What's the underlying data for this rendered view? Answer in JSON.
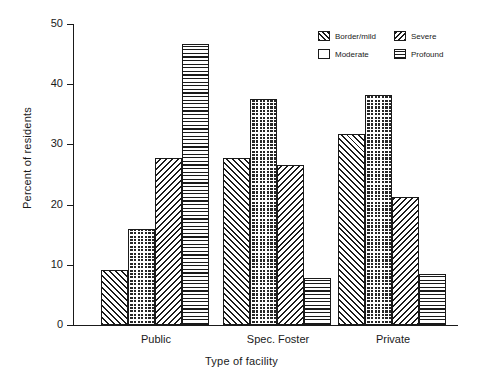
{
  "chart_data": {
    "type": "bar",
    "title": "",
    "subtitle": "",
    "xlabel": "Type of facility",
    "ylabel": "Percent of residents",
    "categories": [
      "Public",
      "Spec. Foster",
      "Private"
    ],
    "series": [
      {
        "name": "Border/mild",
        "pattern": "diagonal-forward-hatch",
        "values": [
          9.2,
          27.8,
          31.8
        ]
      },
      {
        "name": "Moderate",
        "pattern": "dark-checkered",
        "values": [
          16.0,
          37.5,
          38.2
        ]
      },
      {
        "name": "Severe",
        "pattern": "diagonal-back-hatch",
        "values": [
          27.8,
          26.5,
          21.3
        ]
      },
      {
        "name": "Profound",
        "pattern": "horizontal-lines",
        "values": [
          46.7,
          7.8,
          8.5
        ]
      }
    ],
    "ylim": [
      0,
      50
    ],
    "yticks": [
      0,
      10,
      20,
      30,
      40,
      50
    ],
    "ytick_labels": [
      "0",
      "10",
      "20",
      "30",
      "40",
      "50"
    ],
    "grid": false,
    "legend_position": "top-right",
    "axis_color": "#1a1a1a",
    "background_color": "#ffffff"
  },
  "legend": {
    "entries": [
      {
        "label": "Border/mild",
        "pattern": "diagonal-forward-hatch"
      },
      {
        "label": "Severe",
        "pattern": "diagonal-back-hatch"
      },
      {
        "label": "Moderate",
        "pattern": "dark-checkered"
      },
      {
        "label": "Profound",
        "pattern": "horizontal-lines"
      }
    ]
  }
}
